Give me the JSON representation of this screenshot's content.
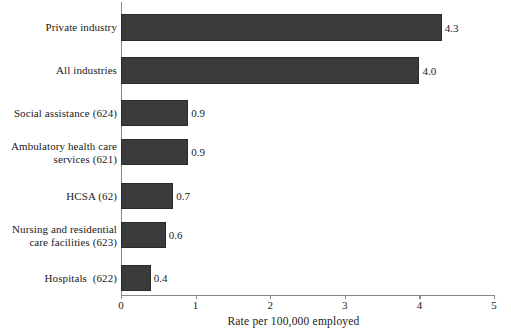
{
  "chart_data": {
    "type": "bar",
    "orientation": "horizontal",
    "title": "",
    "xlabel": "Rate per 100,000 employed",
    "ylabel": "",
    "xlim": [
      0,
      5
    ],
    "xticks": [
      "0",
      "1",
      "2",
      "3",
      "4",
      "5"
    ],
    "grid": false,
    "legend": "none",
    "bar_color": "#3b3b3b",
    "axis_color": "#8a8a8a",
    "categories": [
      "Private industry",
      "All industries",
      "Social assistance (624)",
      "Ambulatory health care\nservices (621)",
      "HCSA (62)",
      "Nursing and residential\ncare facilities (623)",
      "Hospitals  (622)"
    ],
    "values": [
      4.3,
      4.0,
      0.9,
      0.9,
      0.7,
      0.6,
      0.4
    ],
    "value_labels": [
      "4.3",
      "4.0",
      "0.9",
      "0.9",
      "0.7",
      "0.6",
      "0.4"
    ]
  }
}
